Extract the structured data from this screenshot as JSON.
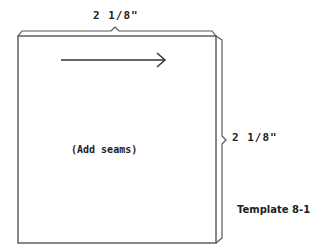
{
  "template": {
    "top_dimension": "2 1/8\"",
    "side_dimension": "2 1/8\"",
    "center_note": "(Add seams)",
    "label": "Template 8-1"
  },
  "colors": {
    "line": "#444444",
    "text": "#222222",
    "background": "#ffffff"
  }
}
